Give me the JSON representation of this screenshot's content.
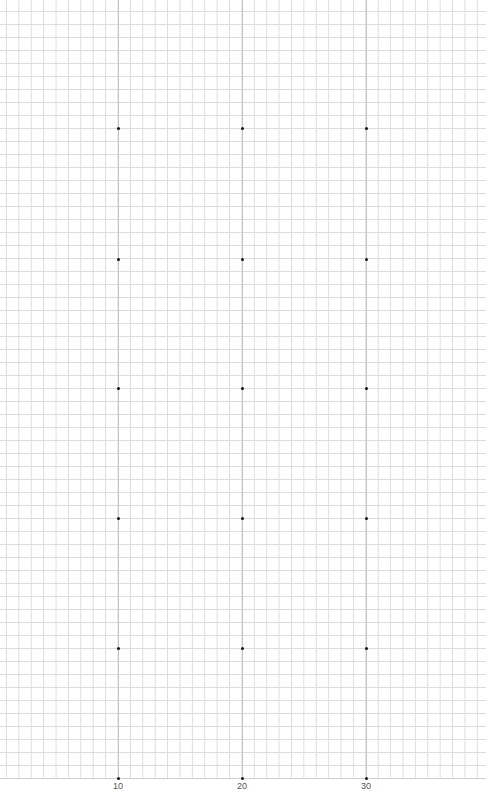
{
  "grid": {
    "minor_line_color": "#dcdcdc",
    "major_line_color": "#c4c4c4",
    "dot_color": "#111111"
  },
  "columns": [
    {
      "label": "10",
      "x": 118
    },
    {
      "label": "20",
      "x": 242
    },
    {
      "label": "30",
      "x": 366
    }
  ],
  "rows_y": [
    128,
    259,
    388,
    518,
    648,
    778
  ],
  "x_axis": {
    "labels": [
      "10",
      "20",
      "30"
    ]
  }
}
